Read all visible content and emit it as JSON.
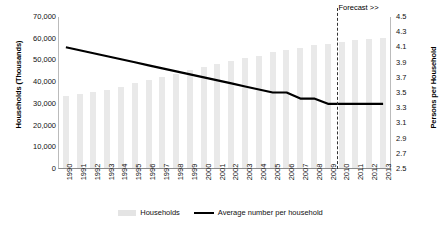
{
  "chart_data": {
    "type": "bar",
    "title": "",
    "xlabel": "",
    "ylabel": "Households (Thousands)",
    "y2label": "Persons per Household",
    "grid": false,
    "legend_position": "bottom",
    "categories": [
      "1990",
      "1991",
      "1992",
      "1993",
      "1994",
      "1995",
      "1996",
      "1997",
      "1998",
      "1999",
      "2000",
      "2001",
      "2002",
      "2003",
      "2004",
      "2005",
      "2006",
      "2007",
      "2008",
      "2009",
      "2010",
      "2011",
      "2012",
      "2013"
    ],
    "ylim": [
      0,
      70000
    ],
    "yticks": [
      "0",
      "10,000",
      "20,000",
      "30,000",
      "40,000",
      "50,000",
      "60,000",
      "70,000"
    ],
    "y2lim": [
      2.5,
      4.5
    ],
    "y2ticks": [
      "2.5",
      "2.7",
      "2.9",
      "3.1",
      "3.3",
      "3.5",
      "3.7",
      "3.9",
      "4.1",
      "4.3",
      "4.5"
    ],
    "series": [
      {
        "name": "Households",
        "type": "bar",
        "axis": "left",
        "color": "#e9e9e9",
        "values": [
          33000,
          34000,
          35000,
          36000,
          37500,
          39000,
          40500,
          42000,
          43500,
          45000,
          46500,
          48000,
          49500,
          50500,
          51500,
          53500,
          54500,
          55500,
          56500,
          57000,
          58000,
          59000,
          59500,
          60000
        ]
      },
      {
        "name": "Average number per household",
        "type": "line",
        "axis": "right",
        "color": "#000000",
        "values": [
          4.1,
          4.06,
          4.02,
          3.98,
          3.94,
          3.9,
          3.86,
          3.82,
          3.78,
          3.74,
          3.7,
          3.66,
          3.62,
          3.58,
          3.54,
          3.5,
          3.5,
          3.42,
          3.42,
          3.35,
          3.35,
          3.35,
          3.35,
          3.35
        ]
      }
    ],
    "annotations": [
      {
        "name": "forecast-divider",
        "label": "Forecast >>",
        "after_category": "2009",
        "style": "dashed-vertical-line"
      }
    ]
  },
  "legend": {
    "items": [
      {
        "label": "Households",
        "marker": "bar-swatch"
      },
      {
        "label": "Average number per household",
        "marker": "line-swatch"
      }
    ]
  }
}
